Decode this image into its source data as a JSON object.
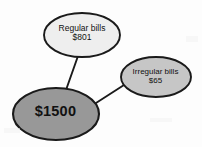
{
  "diagram": {
    "type": "node-link",
    "background_color": "#fdfdfd",
    "stroke_color": "#1a1a1a",
    "nodes": [
      {
        "id": "regular-bills",
        "name": "regular-bills-node",
        "line1": "Regular bills",
        "line2": "$801",
        "amount": 801,
        "currency": "$",
        "fill_color": "#eeeeee",
        "shape": "ellipse",
        "cx": 82,
        "cy": 35,
        "rx": 38,
        "ry": 22
      },
      {
        "id": "irregular-bills",
        "name": "irregular-bills-node",
        "line1": "Irregular bills",
        "line2": "$65",
        "amount": 65,
        "currency": "$",
        "fill_color": "#c6c6c6",
        "shape": "ellipse",
        "cx": 156,
        "cy": 77,
        "rx": 35,
        "ry": 20
      },
      {
        "id": "total",
        "name": "total-node",
        "line1": "$1500",
        "line2": "",
        "amount": 1500,
        "currency": "$",
        "fill_color": "#989898",
        "shape": "ellipse",
        "cx": 56,
        "cy": 114,
        "rx": 43,
        "ry": 26
      }
    ],
    "edges": [
      {
        "name": "edge-total-regular",
        "from": "total",
        "to": "regular-bills"
      },
      {
        "name": "edge-total-irregular",
        "from": "total",
        "to": "irregular-bills"
      }
    ]
  }
}
